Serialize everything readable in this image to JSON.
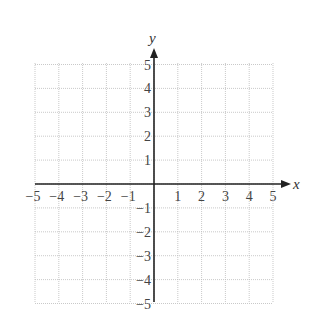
{
  "chart_data": {
    "type": "scatter",
    "title": "",
    "xlabel": "x",
    "ylabel": "y",
    "xlim": [
      -5,
      5
    ],
    "ylim": [
      -5,
      5
    ],
    "grid": true,
    "x_ticks": [
      "−5",
      "−4",
      "−3",
      "−2",
      "−1",
      "1",
      "2",
      "3",
      "4",
      "5"
    ],
    "y_ticks": [
      "5",
      "4",
      "3",
      "2",
      "1",
      "−1",
      "−2",
      "−3",
      "−4",
      "−5"
    ],
    "series": []
  },
  "colors": {
    "axis": "#222222",
    "grid": "#bbbbbb",
    "text": "#444444"
  }
}
